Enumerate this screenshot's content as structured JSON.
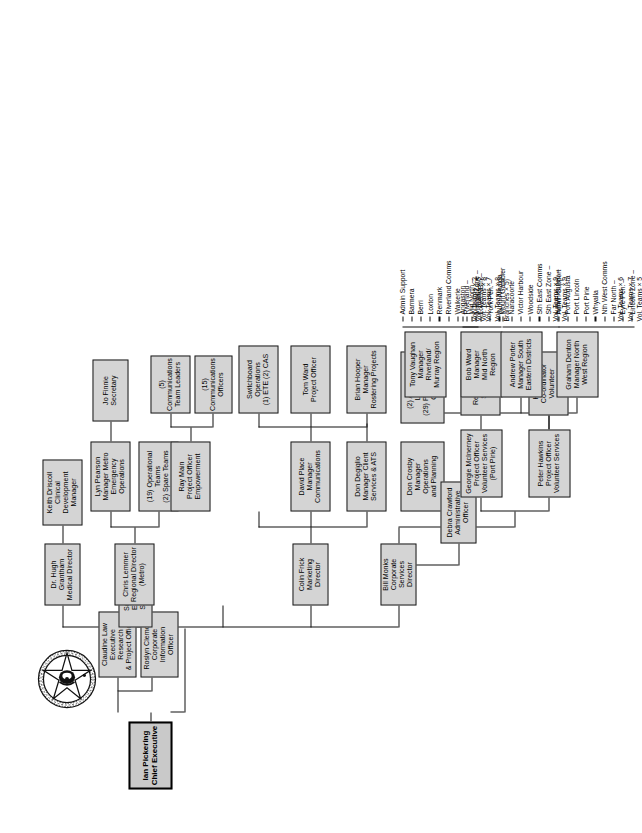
{
  "document": {
    "type": "organisational-chart",
    "orientation": "rotated-90-counterclockwise",
    "logo": "sa-ambulance-service-crest-logo"
  },
  "chart_data": {
    "type": "diagram",
    "root": "Ian Pickering\nChief Executive"
  },
  "nodes": {
    "root": {
      "label": "Ian Pickering\nChief Executive"
    },
    "claudine": {
      "label": "Claudine Law\nExecutive Research\n& Project Officer"
    },
    "roslyn": {
      "label": "Roslyn Clemont\nCorporate Information\nOfficer"
    },
    "sue": {
      "label": "Sue Smith\nExecutive Secretary"
    },
    "bill": {
      "label": "Bill Monks\nCorporate Services\nDirector"
    },
    "kim": {
      "label": "Kim Hosking\nRegional Director\n(Country)"
    },
    "colin": {
      "label": "Colin Frick\nMarketing Director"
    },
    "chris": {
      "label": "Chris Lemmer\nRegional Director\n(Metro)"
    },
    "hugh": {
      "label": "Dr. Hugh Grantham\nMedical Director"
    },
    "keith": {
      "label": "Keith Driscoll\nClinical Development\nManager"
    },
    "lyn": {
      "label": "Lyn Pearson\nManager Metro\nEmergency Operations"
    },
    "jofinnie": {
      "label": "Jo Finnie\nSecretary"
    },
    "opteams": {
      "label": "(19) Operational Teams\n(2) Spare Teams"
    },
    "raymain": {
      "label": "Ray Main\nProject Officer\nEmpowerment"
    },
    "commsleaders": {
      "label": "(5)\nCommunications\nTeam Leaders"
    },
    "commsofficers": {
      "label": "(15)\nCommunications\nOfficers"
    },
    "davidplace": {
      "label": "David Place\nManager\nCommunications"
    },
    "switchboard": {
      "label": "Switchboard\nOperations\n(1) ETE (2) CAS"
    },
    "tomward": {
      "label": "Tom Ward\nProject Officer"
    },
    "brianhooper": {
      "label": "Brian Hooper\nManager\nRostering Projects"
    },
    "dondegiglio": {
      "label": "Don Degiglio\nManager Client\nServices & ATS"
    },
    "atsleaders": {
      "label": "(2) ATS Team\nLeaders\n(29) P + (6) CATS\nOfficers"
    },
    "doncrosby": {
      "label": "Don Crosby\nManager\nOperations\nand Planning"
    },
    "debra": {
      "label": "Debra Crawford\nAdministrative Officer"
    },
    "georgie": {
      "label": "Georgie McInerney\nProject Officer\nVolunteer Services\n(Port Pirie)"
    },
    "peter": {
      "label": "Peter Hawkins\nProject Officer\nVolunteer Services"
    },
    "renee": {
      "label": "Renee Blaser\nSecretary"
    },
    "helen": {
      "label": "Helen Elix\nCo-ordinator\nVolunteer Services"
    },
    "tonyvaughan": {
      "label": "Tony Vaughan\nManager\nRiverland/\nMurray Region"
    },
    "bobward": {
      "label": "Bob Ward\nManager\nMid North\nRegion"
    },
    "andrewporter": {
      "label": "Andrew Porter\nManager South\nEastern Districts"
    },
    "grahamdenton": {
      "label": "Graham Denton\nManager North\nWest Region"
    }
  },
  "leaf_lists": {
    "riverland_murray": {
      "parent": "tonyvaughan",
      "items": [
        "Admin Support",
        "Barmera",
        "Berri",
        "Loxton",
        "Renmark",
        "Riverland Comms",
        "Waikerie",
        "Riverland –\n   Vol. Teams × 2",
        "Murray Zone –\n   Vol. Teams × 8"
      ]
    },
    "mid_north": {
      "parent": "bobward",
      "items": [
        "Angaston",
        "Mid North –\n   Vol. Teams × 5",
        "Lower NBth –\n   Vol. Teams × 7",
        "York Pen. –\n   Vol. Teams × 8",
        "(Non-Amalga.\n   Branches × 5)"
      ]
    },
    "south_eastern": {
      "parent": "andrewporter",
      "items": [
        "Mount Gambier",
        "Naracoorte",
        "Victor Harbour",
        "Woodside",
        "Sth East Comms",
        "Sth East Zone –\n   Vol. Teams × 9",
        "Hills/Fleurieu –\n   Vol. Teams × 9"
      ]
    },
    "north_west": {
      "parent": "grahamdenton",
      "items": [
        "Admin Support",
        "Port Augusta",
        "Port Lincoln",
        "Port Pirie",
        "Whyalla",
        "Nth West Comms",
        "Far North –\n   Vol. Teams × 6",
        "Eyre Pen. –\n   Vol. Teams × 7",
        "Lincoln Zone –\n   Vol. Teams × 5"
      ]
    }
  },
  "colors": {
    "box_fill": "#d4d4d4",
    "box_border": "#1a1a1a",
    "line": "#111111",
    "background": "#ffffff"
  }
}
